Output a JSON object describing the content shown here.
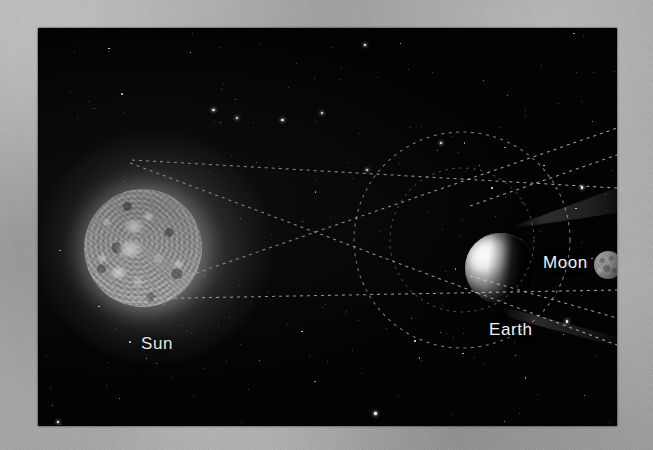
{
  "figure": {
    "type": "astronomy-diagram",
    "background_color": "#a9a9a9",
    "plate_color": "#030303"
  },
  "labels": {
    "sun": "Sun",
    "earth": "Earth",
    "moon": "Moon"
  },
  "bodies": [
    {
      "name": "sun",
      "label": "Sun",
      "center_x": 105,
      "center_y": 220,
      "radius": 59,
      "color": "#c6c6c6",
      "glow": true
    },
    {
      "name": "earth",
      "label": "Earth",
      "center_x": 462,
      "center_y": 240,
      "radius": 35,
      "color": "#b0b0b0",
      "lit_from": "left"
    },
    {
      "name": "moon",
      "label": "Moon",
      "center_x": 570,
      "center_y": 237,
      "radius": 14,
      "color": "#8a8a8a",
      "lit_from": "left"
    }
  ],
  "orbits": [
    {
      "name": "moon-orbit",
      "center_x": 462,
      "center_y": 240,
      "radius": 108,
      "style": "dashed",
      "color": "#d2d2d2"
    },
    {
      "name": "moon-orbit-inner",
      "center_x": 462,
      "center_y": 240,
      "radius": 72,
      "style": "dashed",
      "color": "#c8c8c8"
    }
  ],
  "rays": [
    {
      "name": "sun-top-tangent-to-earth-bottom",
      "x1": 130,
      "y1": 163,
      "x2": 617,
      "y2": 345,
      "style": "dashed"
    },
    {
      "name": "sun-bottom-tangent-to-earth-top",
      "x1": 130,
      "y1": 296,
      "x2": 617,
      "y2": 128,
      "style": "dashed"
    },
    {
      "name": "sun-top-parallel",
      "x1": 132,
      "y1": 160,
      "x2": 617,
      "y2": 188,
      "style": "dashed"
    },
    {
      "name": "sun-bottom-parallel",
      "x1": 132,
      "y1": 299,
      "x2": 617,
      "y2": 290,
      "style": "dashed"
    },
    {
      "name": "penumbra-upper-edge",
      "x1": 470,
      "y1": 206,
      "x2": 617,
      "y2": 155,
      "style": "dashed"
    },
    {
      "name": "penumbra-lower-edge",
      "x1": 470,
      "y1": 276,
      "x2": 617,
      "y2": 318,
      "style": "dashed"
    }
  ],
  "shadow_cone": {
    "name": "earth-shadow-penumbra",
    "origin_x": 470,
    "origin_y": 240,
    "direction": "right",
    "visible": true
  },
  "starfield": {
    "count": 210,
    "color": "#ffffff"
  },
  "plate": {
    "left": 38,
    "top": 28,
    "width": 579,
    "height": 398
  }
}
